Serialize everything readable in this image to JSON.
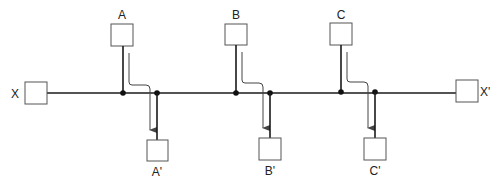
{
  "diagram": {
    "colors": {
      "stroke": "#1a1a1a",
      "box_stroke": "#555555",
      "arrow": "#444444",
      "background": "#ffffff"
    },
    "endpoints": {
      "left": {
        "label": "X"
      },
      "right": {
        "label": "X'"
      }
    },
    "taps": [
      {
        "source": "A",
        "destination": "A'"
      },
      {
        "source": "B",
        "destination": "B'"
      },
      {
        "source": "C",
        "destination": "C'"
      }
    ]
  }
}
